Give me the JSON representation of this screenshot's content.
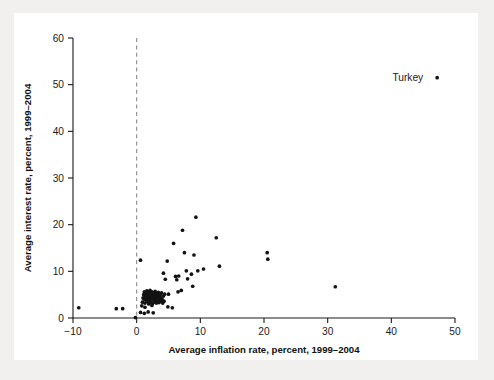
{
  "figure": {
    "background_color": "#f1f0ee",
    "plot_background_color": "#ffffff",
    "point_color": "#131313",
    "axis_color": "#1b1b1b",
    "zero_line_color": "#8b8b8b"
  },
  "chart_data": {
    "type": "scatter",
    "title": "",
    "xlabel": "Average inflation rate, percent, 1999–2004",
    "ylabel": "Average interest rate, percent, 1999–2004",
    "xlim": [
      -10,
      50
    ],
    "ylim": [
      0,
      60
    ],
    "xticks": [
      -10,
      0,
      10,
      20,
      30,
      40,
      50
    ],
    "xtick_labels": [
      "−10",
      "0",
      "10",
      "20",
      "30",
      "40",
      "50"
    ],
    "yticks": [
      0,
      10,
      20,
      30,
      40,
      50,
      60
    ],
    "ytick_labels": [
      "0",
      "10",
      "20",
      "30",
      "40",
      "50",
      "60"
    ],
    "grid": false,
    "legend_position": "top-right",
    "reference_lines": [
      {
        "orientation": "vertical",
        "value": 0,
        "style": "dashed",
        "color": "#8b8b8b"
      }
    ],
    "annotations": [
      {
        "text": "Turkey",
        "x": 45.0,
        "y": 51.5,
        "marker": true
      }
    ],
    "series": [
      {
        "name": "Countries",
        "points": [
          [
            -9.1,
            2.2
          ],
          [
            -3.2,
            2.0
          ],
          [
            -2.2,
            2.0
          ],
          [
            -0.2,
            0.1
          ],
          [
            0.6,
            1.2
          ],
          [
            0.8,
            2.6
          ],
          [
            0.9,
            3.4
          ],
          [
            1.0,
            4.3
          ],
          [
            1.1,
            5.0
          ],
          [
            1.2,
            4.0
          ],
          [
            1.2,
            5.6
          ],
          [
            1.3,
            2.3
          ],
          [
            1.3,
            3.2
          ],
          [
            1.4,
            4.6
          ],
          [
            1.4,
            5.3
          ],
          [
            1.5,
            3.8
          ],
          [
            1.5,
            4.9
          ],
          [
            1.6,
            5.8
          ],
          [
            1.6,
            4.2
          ],
          [
            1.7,
            3.5
          ],
          [
            1.7,
            5.1
          ],
          [
            1.8,
            4.4
          ],
          [
            1.8,
            5.5
          ],
          [
            1.9,
            3.0
          ],
          [
            1.9,
            4.7
          ],
          [
            2.0,
            5.3
          ],
          [
            2.0,
            4.1
          ],
          [
            2.1,
            3.6
          ],
          [
            2.1,
            5.9
          ],
          [
            2.2,
            4.8
          ],
          [
            2.2,
            3.3
          ],
          [
            2.3,
            5.2
          ],
          [
            2.3,
            4.3
          ],
          [
            2.4,
            2.7
          ],
          [
            2.4,
            5.6
          ],
          [
            2.5,
            4.0
          ],
          [
            2.5,
            3.1
          ],
          [
            2.6,
            4.9
          ],
          [
            2.6,
            5.4
          ],
          [
            2.7,
            3.7
          ],
          [
            2.7,
            4.5
          ],
          [
            2.8,
            5.1
          ],
          [
            2.8,
            3.4
          ],
          [
            2.9,
            4.2
          ],
          [
            2.9,
            5.7
          ],
          [
            3.0,
            3.9
          ],
          [
            3.0,
            4.6
          ],
          [
            3.1,
            5.0
          ],
          [
            3.1,
            3.2
          ],
          [
            3.2,
            4.4
          ],
          [
            3.2,
            5.3
          ],
          [
            3.3,
            3.6
          ],
          [
            3.3,
            4.8
          ],
          [
            3.4,
            5.5
          ],
          [
            3.4,
            4.1
          ],
          [
            3.5,
            3.3
          ],
          [
            3.5,
            5.2
          ],
          [
            3.6,
            4.5
          ],
          [
            3.7,
            3.8
          ],
          [
            3.7,
            5.0
          ],
          [
            3.8,
            4.3
          ],
          [
            3.9,
            3.5
          ],
          [
            3.9,
            5.4
          ],
          [
            4.0,
            4.0
          ],
          [
            4.1,
            3.2
          ],
          [
            4.2,
            4.7
          ],
          [
            4.3,
            3.6
          ],
          [
            4.4,
            5.1
          ],
          [
            0.6,
            12.4
          ],
          [
            1.2,
            1.0
          ],
          [
            1.8,
            1.3
          ],
          [
            2.6,
            1.1
          ],
          [
            4.2,
            9.6
          ],
          [
            4.5,
            8.3
          ],
          [
            4.8,
            12.2
          ],
          [
            4.9,
            2.4
          ],
          [
            5.0,
            5.1
          ],
          [
            5.6,
            2.2
          ],
          [
            5.8,
            16.0
          ],
          [
            6.1,
            8.9
          ],
          [
            6.3,
            8.2
          ],
          [
            6.5,
            5.6
          ],
          [
            6.6,
            9.0
          ],
          [
            7.0,
            5.9
          ],
          [
            7.2,
            18.8
          ],
          [
            7.5,
            14.0
          ],
          [
            7.8,
            10.1
          ],
          [
            8.0,
            8.4
          ],
          [
            8.6,
            9.4
          ],
          [
            8.8,
            6.8
          ],
          [
            9.0,
            13.5
          ],
          [
            9.3,
            21.6
          ],
          [
            9.6,
            10.1
          ],
          [
            10.5,
            10.5
          ],
          [
            12.5,
            17.2
          ],
          [
            13.0,
            11.1
          ],
          [
            20.5,
            14.0
          ],
          [
            20.6,
            12.6
          ],
          [
            31.2,
            6.7
          ]
        ]
      }
    ]
  }
}
